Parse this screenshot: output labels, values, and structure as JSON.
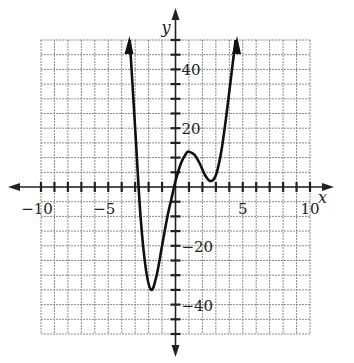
{
  "chart_data": {
    "type": "line",
    "title": "",
    "xlabel": "x",
    "ylabel": "y",
    "xlim": [
      -10,
      10
    ],
    "ylim": [
      -50,
      50
    ],
    "grid": true,
    "x_grid_step": 1,
    "y_grid_step": 5,
    "x_tick_labels": [
      "-10",
      "-5",
      "5",
      "10"
    ],
    "y_tick_labels": [
      "40",
      "20",
      "-20",
      "-40"
    ],
    "series": [
      {
        "name": "curve",
        "description": "polynomial with roots near x=-3, x=0, local min near (-2,-34), local max near (1,12), local min near (3,4), arrows at both ends",
        "x": [
          -3.4,
          -3.0,
          -2.6,
          -2.2,
          -1.8,
          -1.4,
          -1.0,
          -0.6,
          -0.2,
          0.0,
          0.4,
          0.8,
          1.0,
          1.4,
          1.8,
          2.2,
          2.6,
          3.0,
          3.4,
          3.8,
          4.2,
          4.6
        ],
        "y": [
          50,
          20,
          -10,
          -28,
          -35,
          -30,
          -20,
          -10,
          -2,
          2,
          8,
          11.5,
          12,
          11,
          8,
          4,
          2,
          4,
          12,
          25,
          40,
          55
        ]
      }
    ]
  },
  "axes": {
    "x_label": "x",
    "y_label": "y",
    "tick_labels_x": [
      "−10",
      "−5",
      "5",
      "10"
    ],
    "tick_labels_y": [
      "40",
      "20",
      "−20",
      "−40"
    ]
  }
}
